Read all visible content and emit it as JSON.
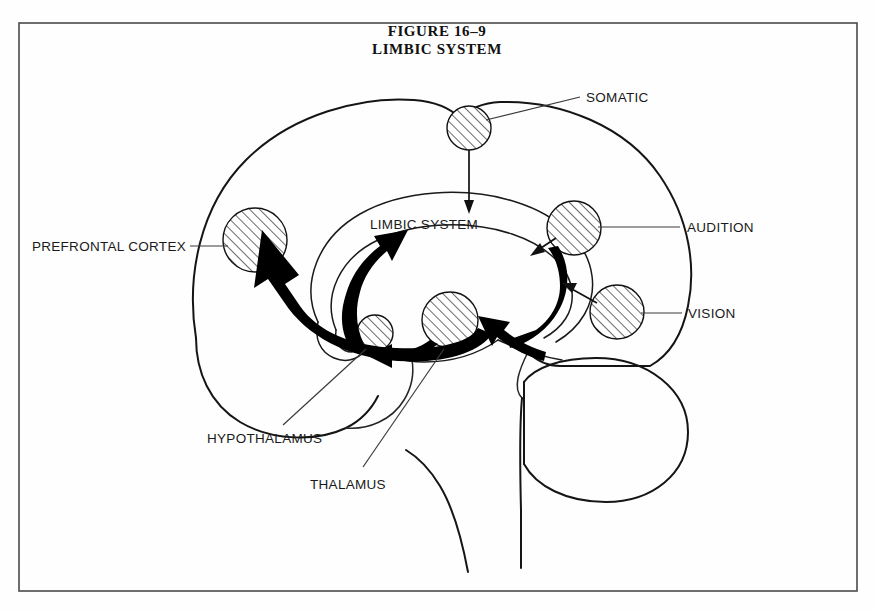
{
  "figure": {
    "title_line1": "FIGURE 16–9",
    "title_line2": "LIMBIC SYSTEM",
    "border_color": "#4a4a4a",
    "background_color": "#ffffff",
    "ink_color": "#111111"
  },
  "inner_label": {
    "limbic_system": "LIMBIC SYSTEM"
  },
  "labels": {
    "prefrontal_cortex": "PREFRONTAL CORTEX",
    "somatic": "SOMATIC",
    "audition": "AUDITION",
    "vision": "VISION",
    "hypothalamus": "HYPOTHALAMUS",
    "thalamus": "THALAMUS"
  },
  "structures": [
    {
      "name": "prefrontal-cortex-region",
      "label": "PREFRONTAL CORTEX",
      "shape": "hatched-circle",
      "cx": 255,
      "cy": 240,
      "r": 32,
      "fill": "diagonal-hatch"
    },
    {
      "name": "somatic-region",
      "label": "SOMATIC",
      "shape": "hatched-circle",
      "cx": 469,
      "cy": 128,
      "r": 22,
      "fill": "diagonal-hatch"
    },
    {
      "name": "audition-region",
      "label": "AUDITION",
      "shape": "hatched-circle",
      "cx": 574,
      "cy": 228,
      "r": 27,
      "fill": "diagonal-hatch"
    },
    {
      "name": "vision-region",
      "label": "VISION",
      "shape": "hatched-circle",
      "cx": 617,
      "cy": 312,
      "r": 27,
      "fill": "diagonal-hatch"
    },
    {
      "name": "thalamus-region",
      "label": "THALAMUS",
      "shape": "hatched-circle",
      "cx": 450,
      "cy": 320,
      "r": 28,
      "fill": "diagonal-hatch"
    },
    {
      "name": "hypothalamus-region",
      "label": "HYPOTHALAMUS",
      "shape": "hatched-circle",
      "cx": 375,
      "cy": 333,
      "r": 18,
      "fill": "diagonal-hatch"
    }
  ],
  "connections": [
    {
      "from": "SOMATIC",
      "to": "LIMBIC SYSTEM",
      "style": "thin-arrow"
    },
    {
      "from": "AUDITION",
      "to": "LIMBIC SYSTEM",
      "style": "thin-arrow"
    },
    {
      "from": "VISION",
      "to": "LIMBIC SYSTEM",
      "style": "thin-arrow"
    },
    {
      "from": "THALAMUS",
      "to": "PREFRONTAL CORTEX",
      "style": "bold-arrow"
    },
    {
      "from": "THALAMUS",
      "to": "HYPOTHALAMUS",
      "style": "bold-arrow"
    },
    {
      "from": "LIMBIC SYSTEM",
      "to": "THALAMUS",
      "style": "bold-arrow"
    },
    {
      "from": "HYPOTHALAMUS",
      "to": "LIMBIC SYSTEM",
      "style": "bold-arrow"
    }
  ]
}
